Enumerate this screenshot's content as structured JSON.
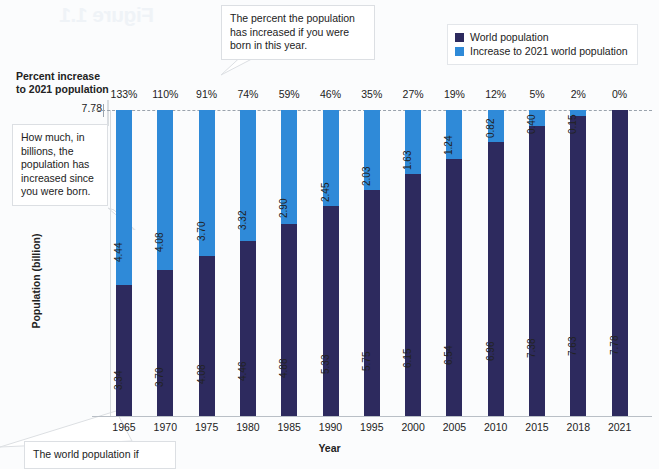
{
  "chart_data": {
    "type": "bar",
    "subtype": "stacked-bar",
    "title": "",
    "xlabel": "Year",
    "ylabel": "Population (billion)",
    "categories": [
      "1965",
      "1970",
      "1975",
      "1980",
      "1985",
      "1990",
      "1995",
      "2000",
      "2005",
      "2010",
      "2015",
      "2018",
      "2021"
    ],
    "series": [
      {
        "name": "World population",
        "color": "#2d2a5e",
        "values": [
          3.34,
          3.7,
          4.08,
          4.46,
          4.88,
          5.33,
          5.75,
          6.15,
          6.54,
          6.96,
          7.38,
          7.63,
          7.78
        ]
      },
      {
        "name": "Increase to 2021 world population",
        "color": "#2f8ad8",
        "values": [
          4.44,
          4.08,
          3.7,
          3.32,
          2.9,
          2.45,
          2.03,
          1.63,
          1.24,
          0.82,
          0.4,
          0.15,
          0.0
        ]
      }
    ],
    "percent_increase_labels": [
      "133%",
      "110%",
      "91%",
      "74%",
      "59%",
      "46%",
      "35%",
      "27%",
      "19%",
      "12%",
      "5%",
      "2%",
      "0%"
    ],
    "reference_line": {
      "value": "7.78",
      "style": "dashed"
    },
    "ylim": [
      0,
      7.78
    ],
    "grid": false,
    "legend_position": "top-right",
    "stack_total": "7.78"
  },
  "legend": {
    "items": [
      {
        "label": "World population",
        "color": "#2d2a5e"
      },
      {
        "label": "Increase to 2021 world population",
        "color": "#2f8ad8"
      }
    ]
  },
  "labels": {
    "percent_header": "Percent increase to 2021 population",
    "percent_header_line1": "Percent increase",
    "percent_header_line2": "to 2021 population",
    "y_axis_reference": "7.78",
    "y_axis_title": "Population (billion)",
    "x_axis_title": "Year"
  },
  "callouts": {
    "percent": "The percent the population has increased if you were born in this year.",
    "billions": "How much, in billions, the population has increased since you were born.",
    "bottom": "The world population if"
  },
  "bleed_artifact": "Figure 1.1"
}
